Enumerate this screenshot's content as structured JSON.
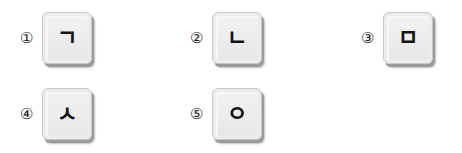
{
  "options": [
    {
      "number": "①",
      "key": "ㄱ"
    },
    {
      "number": "②",
      "key": "ㄴ"
    },
    {
      "number": "③",
      "key": "ㅁ"
    },
    {
      "number": "④",
      "key": "ㅅ"
    },
    {
      "number": "⑤",
      "key": "ㅇ"
    }
  ]
}
